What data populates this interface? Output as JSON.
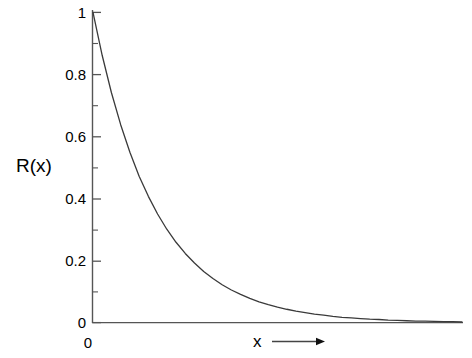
{
  "chart_data": {
    "type": "line",
    "title": "",
    "subtitle": "",
    "xlabel": "x",
    "ylabel": "R(x)",
    "xlabel_arrow": "arrow-right",
    "x_origin_label": "0",
    "grid": false,
    "legend": null,
    "xlim": [
      0,
      6
    ],
    "ylim": [
      0,
      1
    ],
    "x_tick_labels": [
      "0"
    ],
    "y_tick_labels": [
      "0",
      "0.2",
      "0.4",
      "0.6",
      "0.8",
      "1"
    ],
    "y_tick_values": [
      0,
      0.2,
      0.4,
      0.6,
      0.8,
      1
    ],
    "y_minor_tick_values": [
      0.1,
      0.3,
      0.5,
      0.7,
      0.9
    ],
    "series": [
      {
        "name": "R(x)",
        "function": "exponential-decay",
        "color": "#3a3a3a",
        "x": [
          0.0,
          0.15,
          0.3,
          0.45,
          0.6,
          0.75,
          0.9,
          1.05,
          1.2,
          1.35,
          1.5,
          1.65,
          1.8,
          1.95,
          2.1,
          2.25,
          2.4,
          2.55,
          2.7,
          2.85,
          3.0,
          3.15,
          3.3,
          3.45,
          3.6,
          3.75,
          3.9,
          4.05,
          4.2,
          4.35,
          4.5,
          4.65,
          4.8,
          4.95,
          5.1,
          5.25,
          5.4,
          5.55,
          5.7,
          5.85,
          6.0
        ],
        "y": [
          1.0,
          0.861,
          0.741,
          0.638,
          0.549,
          0.472,
          0.407,
          0.35,
          0.301,
          0.259,
          0.223,
          0.192,
          0.165,
          0.142,
          0.122,
          0.105,
          0.091,
          0.078,
          0.067,
          0.058,
          0.05,
          0.043,
          0.037,
          0.032,
          0.027,
          0.024,
          0.02,
          0.017,
          0.015,
          0.013,
          0.011,
          0.01,
          0.008,
          0.007,
          0.006,
          0.005,
          0.005,
          0.004,
          0.003,
          0.003,
          0.002
        ]
      }
    ],
    "axis_color": "#555555",
    "curve_color": "#3a3a3a",
    "background": "#ffffff"
  },
  "labels": {
    "y_axis": "R(x)",
    "x_axis": "x",
    "origin": "0",
    "y_ticks": {
      "t1": "1",
      "t08": "0.8",
      "t06": "0.6",
      "t04": "0.4",
      "t02": "0.2",
      "t0": "0"
    }
  }
}
